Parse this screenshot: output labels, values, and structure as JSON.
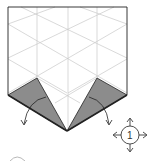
{
  "diagram": {
    "type": "origami-instruction",
    "step_symbol": {
      "label": "1",
      "meaning": "rotate/turn symbol with four arrows"
    },
    "colors": {
      "paper": "#ffffff",
      "folded_flap": "#8c8c8c",
      "grid_line": "#c8c8c8",
      "edge": "#222222"
    },
    "flaps": [
      {
        "name": "left-flap",
        "direction": "fold-down-left"
      },
      {
        "name": "right-flap",
        "direction": "fold-down-right"
      }
    ]
  }
}
